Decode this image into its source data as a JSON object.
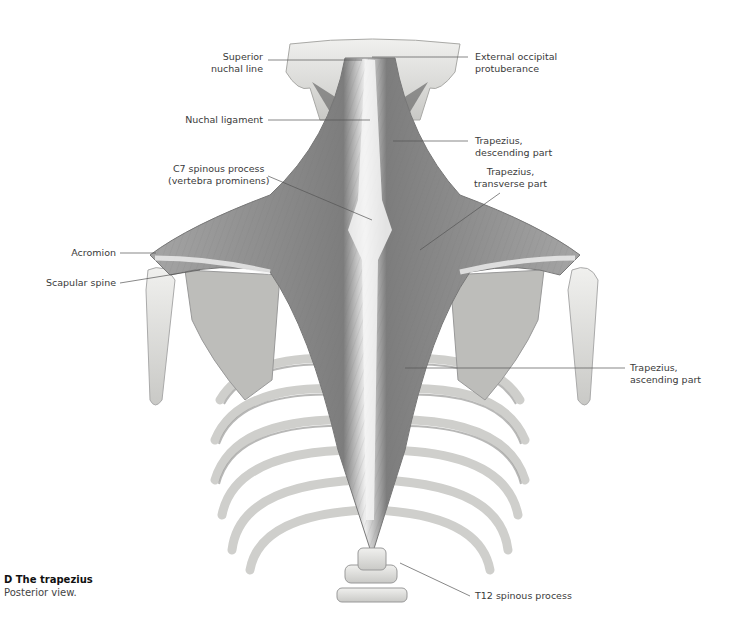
{
  "figure": {
    "caption_title": "D  The trapezius",
    "caption_subtitle": "Posterior view.",
    "colors": {
      "background": "#ffffff",
      "muscle": "#8c8c8c",
      "muscle_dark": "#6e6e6e",
      "tendon": "#f2f2f2",
      "bone": "#e6e6e4",
      "bone_shadow": "#b5b5b2",
      "leader_line": "#555555",
      "label_text": "#3a3a3a"
    }
  },
  "labels": [
    {
      "id": "superior-nuchal-line",
      "text": "Superior\nnuchal line",
      "side": "left"
    },
    {
      "id": "external-occipital-protuberance",
      "text": "External occipital\nprotuberance",
      "side": "right"
    },
    {
      "id": "nuchal-ligament",
      "text": "Nuchal ligament",
      "side": "left"
    },
    {
      "id": "trapezius-descending-part",
      "text": "Trapezius,\ndescending part",
      "side": "right"
    },
    {
      "id": "c7-spinous-process",
      "text": "C7 spinous process\n(vertebra prominens)",
      "side": "left"
    },
    {
      "id": "trapezius-transverse-part",
      "text": "Trapezius,\ntransverse part",
      "side": "right"
    },
    {
      "id": "acromion",
      "text": "Acromion",
      "side": "left"
    },
    {
      "id": "scapular-spine",
      "text": "Scapular spine",
      "side": "left"
    },
    {
      "id": "trapezius-ascending-part",
      "text": "Trapezius,\nascending part",
      "side": "right"
    },
    {
      "id": "t12-spinous-process",
      "text": "T12 spinous process",
      "side": "right"
    }
  ]
}
